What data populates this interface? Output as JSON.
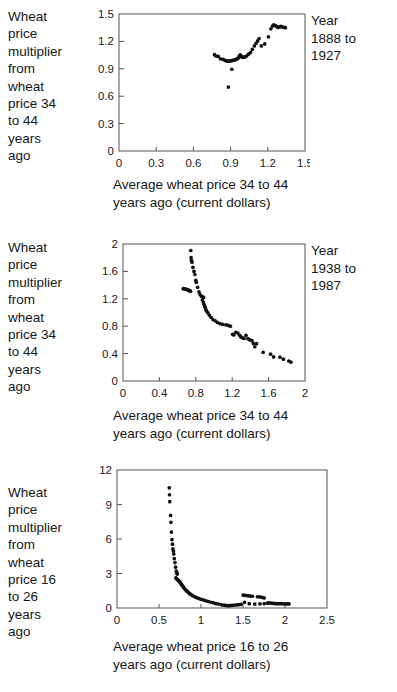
{
  "page": {
    "background_color": "#ffffff",
    "text_color": "#161616",
    "axis_color": "#555555",
    "marker_color": "#111111"
  },
  "figures": [
    {
      "id": "figure-1",
      "ylabel": "Wheat\nprice\nmultiplier\nfrom\nwheat\nprice 34\nto 44\nyears\nago",
      "year_note": "Year\n1888 to\n1927",
      "xcaption": "Average wheat price 34 to 44\nyears ago (current dollars)",
      "chart_data": {
        "type": "scatter",
        "title": "",
        "xlabel": "Average wheat price 34 to 44 years ago (current dollars)",
        "ylabel": "Wheat price multiplier from wheat price 34 to 44 years ago",
        "annotation": "Year 1888 to 1927",
        "xlim": [
          0,
          1.5
        ],
        "ylim": [
          0,
          1.5
        ],
        "xticks": [
          0,
          0.3,
          0.6,
          0.9,
          1.2,
          1.5
        ],
        "xticklabels": [
          "0",
          "0.3",
          "0.6",
          "0.9",
          "1.2",
          "1.5"
        ],
        "yticks": [
          0,
          0.3,
          0.6,
          0.9,
          1.2,
          1.5
        ],
        "yticklabels": [
          "0",
          "0.3",
          "0.6",
          "0.9",
          "1.2",
          "1.5"
        ],
        "grid": false,
        "legend": false,
        "points": [
          [
            0.77,
            1.055
          ],
          [
            0.782,
            1.04
          ],
          [
            0.8,
            1.035
          ],
          [
            0.818,
            1.01
          ],
          [
            0.838,
            1.003
          ],
          [
            0.852,
            0.995
          ],
          [
            0.862,
            0.988
          ],
          [
            0.872,
            0.985
          ],
          [
            0.88,
            0.985
          ],
          [
            0.892,
            0.985
          ],
          [
            0.9,
            0.988
          ],
          [
            0.906,
            0.99
          ],
          [
            0.918,
            0.992
          ],
          [
            0.928,
            0.995
          ],
          [
            0.938,
            1.0
          ],
          [
            0.948,
            1.005
          ],
          [
            0.955,
            1.01
          ],
          [
            0.962,
            1.018
          ],
          [
            0.968,
            1.03
          ],
          [
            0.972,
            1.042
          ],
          [
            0.978,
            1.052
          ],
          [
            0.985,
            1.04
          ],
          [
            0.992,
            1.03
          ],
          [
            1.0,
            1.025
          ],
          [
            1.01,
            1.028
          ],
          [
            1.02,
            1.032
          ],
          [
            1.03,
            1.042
          ],
          [
            1.045,
            1.06
          ],
          [
            1.06,
            1.078
          ],
          [
            1.075,
            1.112
          ],
          [
            1.092,
            1.15
          ],
          [
            1.105,
            1.18
          ],
          [
            1.118,
            1.205
          ],
          [
            1.13,
            1.232
          ],
          [
            1.148,
            1.15
          ],
          [
            1.175,
            1.172
          ],
          [
            1.205,
            1.25
          ],
          [
            1.225,
            1.338
          ],
          [
            1.238,
            1.368
          ],
          [
            1.248,
            1.382
          ],
          [
            1.262,
            1.372
          ],
          [
            1.272,
            1.362
          ],
          [
            1.282,
            1.352
          ],
          [
            1.295,
            1.358
          ],
          [
            1.305,
            1.365
          ],
          [
            1.318,
            1.36
          ],
          [
            1.33,
            1.352
          ],
          [
            1.342,
            1.35
          ],
          [
            0.91,
            0.895
          ],
          [
            0.882,
            0.7
          ]
        ]
      }
    },
    {
      "id": "figure-2",
      "ylabel": "Wheat\nprice\nmultiplier\nfrom\nwheat\nprice 34\nto 44\nyears\nago",
      "year_note": "Year\n1938 to\n1987",
      "xcaption": "Average wheat price 34 to 44\nyears ago (current dollars)",
      "chart_data": {
        "type": "scatter",
        "title": "",
        "xlabel": "Average wheat price 34 to 44 years ago (current dollars)",
        "ylabel": "Wheat price multiplier from wheat price 34 to 44 years ago",
        "annotation": "Year 1938 to 1987",
        "xlim": [
          0,
          2
        ],
        "ylim": [
          0,
          2
        ],
        "xticks": [
          0,
          0.4,
          0.8,
          1.2,
          1.6,
          2
        ],
        "xticklabels": [
          "0",
          "0.4",
          "0.8",
          "1.2",
          "1.6",
          "2"
        ],
        "yticks": [
          0,
          0.4,
          0.8,
          1.2,
          1.6,
          2
        ],
        "yticklabels": [
          "0",
          "0.4",
          "0.8",
          "1.2",
          "1.6",
          "2"
        ],
        "grid": false,
        "legend": false,
        "points": [
          [
            0.745,
            1.905
          ],
          [
            0.748,
            1.8
          ],
          [
            0.752,
            1.76
          ],
          [
            0.758,
            1.735
          ],
          [
            0.768,
            1.66
          ],
          [
            0.78,
            1.6
          ],
          [
            0.79,
            1.555
          ],
          [
            0.8,
            1.47
          ],
          [
            0.805,
            1.44
          ],
          [
            0.662,
            1.348
          ],
          [
            0.672,
            1.345
          ],
          [
            0.682,
            1.342
          ],
          [
            0.692,
            1.34
          ],
          [
            0.702,
            1.336
          ],
          [
            0.712,
            1.33
          ],
          [
            0.722,
            1.322
          ],
          [
            0.732,
            1.318
          ],
          [
            0.742,
            1.312
          ],
          [
            0.82,
            1.368
          ],
          [
            0.835,
            1.3
          ],
          [
            0.848,
            1.262
          ],
          [
            0.862,
            1.238
          ],
          [
            0.875,
            1.23
          ],
          [
            0.885,
            1.222
          ],
          [
            0.872,
            1.185
          ],
          [
            0.882,
            1.152
          ],
          [
            0.89,
            1.12
          ],
          [
            0.898,
            1.09
          ],
          [
            0.905,
            1.065
          ],
          [
            0.912,
            1.04
          ],
          [
            0.92,
            1.02
          ],
          [
            0.932,
            0.995
          ],
          [
            0.948,
            0.962
          ],
          [
            0.968,
            0.93
          ],
          [
            0.988,
            0.898
          ],
          [
            1.012,
            0.878
          ],
          [
            1.038,
            0.855
          ],
          [
            1.065,
            0.838
          ],
          [
            1.095,
            0.828
          ],
          [
            1.13,
            0.82
          ],
          [
            1.155,
            0.812
          ],
          [
            1.18,
            0.8
          ],
          [
            1.205,
            0.682
          ],
          [
            1.218,
            0.672
          ],
          [
            1.24,
            0.712
          ],
          [
            1.262,
            0.7
          ],
          [
            1.282,
            0.668
          ],
          [
            1.298,
            0.64
          ],
          [
            1.318,
            0.628
          ],
          [
            1.33,
            0.622
          ],
          [
            1.352,
            0.668
          ],
          [
            1.372,
            0.618
          ],
          [
            1.395,
            0.6
          ],
          [
            1.418,
            0.588
          ],
          [
            1.432,
            0.548
          ],
          [
            1.448,
            0.5
          ],
          [
            1.468,
            0.545
          ],
          [
            1.54,
            0.418
          ],
          [
            1.622,
            0.392
          ],
          [
            1.655,
            0.352
          ],
          [
            1.725,
            0.348
          ],
          [
            1.762,
            0.318
          ],
          [
            1.822,
            0.292
          ],
          [
            1.845,
            0.275
          ]
        ]
      }
    },
    {
      "id": "figure-3",
      "ylabel": "Wheat\nprice\nmultiplier\nfrom\nwheat\nprice 16\nto 26\nyears\nago",
      "year_note": "",
      "xcaption": "Average wheat price 16 to 26\nyears ago (current dollars)",
      "chart_data": {
        "type": "scatter",
        "title": "",
        "xlabel": "Average wheat price 16 to 26 years ago (current dollars)",
        "ylabel": "Wheat price multiplier from wheat price 16 to 26 years ago",
        "annotation": "",
        "xlim": [
          0,
          2.5
        ],
        "ylim": [
          0,
          12
        ],
        "xticks": [
          0,
          0.5,
          1,
          1.5,
          2,
          2.5
        ],
        "xticklabels": [
          "0",
          "0.5",
          "1",
          "1.5",
          "2",
          "2.5"
        ],
        "yticks": [
          0,
          3,
          6,
          9,
          12
        ],
        "yticklabels": [
          "0",
          "3",
          "6",
          "9",
          "12"
        ],
        "grid": false,
        "legend": false,
        "points": [
          [
            0.622,
            10.45
          ],
          [
            0.625,
            9.85
          ],
          [
            0.628,
            9.25
          ],
          [
            0.638,
            8.05
          ],
          [
            0.642,
            7.45
          ],
          [
            0.648,
            6.6
          ],
          [
            0.655,
            5.95
          ],
          [
            0.66,
            5.55
          ],
          [
            0.665,
            5.15
          ],
          [
            0.672,
            4.95
          ],
          [
            0.676,
            4.7
          ],
          [
            0.682,
            4.3
          ],
          [
            0.69,
            3.95
          ],
          [
            0.698,
            3.55
          ],
          [
            0.706,
            3.2
          ],
          [
            0.712,
            3.05
          ],
          [
            0.718,
            2.95
          ],
          [
            0.7,
            2.62
          ],
          [
            0.708,
            2.55
          ],
          [
            0.718,
            2.48
          ],
          [
            0.728,
            2.42
          ],
          [
            0.736,
            2.35
          ],
          [
            0.745,
            2.3
          ],
          [
            0.752,
            2.22
          ],
          [
            0.76,
            2.12
          ],
          [
            0.768,
            2.05
          ],
          [
            0.776,
            1.96
          ],
          [
            0.788,
            1.85
          ],
          [
            0.8,
            1.72
          ],
          [
            0.812,
            1.62
          ],
          [
            0.824,
            1.52
          ],
          [
            0.836,
            1.44
          ],
          [
            0.85,
            1.35
          ],
          [
            0.866,
            1.25
          ],
          [
            0.882,
            1.16
          ],
          [
            0.9,
            1.08
          ],
          [
            0.92,
            1.0
          ],
          [
            0.94,
            0.92
          ],
          [
            0.962,
            0.86
          ],
          [
            0.985,
            0.8
          ],
          [
            1.008,
            0.74
          ],
          [
            1.035,
            0.68
          ],
          [
            1.062,
            0.62
          ],
          [
            1.09,
            0.56
          ],
          [
            1.12,
            0.5
          ],
          [
            1.15,
            0.44
          ],
          [
            1.18,
            0.38
          ],
          [
            1.212,
            0.34
          ],
          [
            1.245,
            0.28
          ],
          [
            1.272,
            0.25
          ],
          [
            1.295,
            0.22
          ],
          [
            1.318,
            0.2
          ],
          [
            1.34,
            0.2
          ],
          [
            1.362,
            0.22
          ],
          [
            1.385,
            0.24
          ],
          [
            1.408,
            0.26
          ],
          [
            1.432,
            0.28
          ],
          [
            1.455,
            0.3
          ],
          [
            1.478,
            0.32
          ],
          [
            1.502,
            1.12
          ],
          [
            1.522,
            1.1
          ],
          [
            1.545,
            1.08
          ],
          [
            1.568,
            1.06
          ],
          [
            1.59,
            1.04
          ],
          [
            1.612,
            1.02
          ],
          [
            1.518,
            0.5
          ],
          [
            1.575,
            0.38
          ],
          [
            1.64,
            0.34
          ],
          [
            1.672,
            0.98
          ],
          [
            1.7,
            0.96
          ],
          [
            1.728,
            0.92
          ],
          [
            1.752,
            0.88
          ],
          [
            1.702,
            0.36
          ],
          [
            1.752,
            0.38
          ],
          [
            1.79,
            0.42
          ],
          [
            1.812,
            0.44
          ],
          [
            1.838,
            0.42
          ],
          [
            1.862,
            0.4
          ],
          [
            1.888,
            0.38
          ],
          [
            1.912,
            0.38
          ],
          [
            1.938,
            0.38
          ],
          [
            1.962,
            0.38
          ],
          [
            1.985,
            0.36
          ],
          [
            2.008,
            0.36
          ],
          [
            2.028,
            0.36
          ],
          [
            2.048,
            0.36
          ]
        ]
      }
    }
  ]
}
